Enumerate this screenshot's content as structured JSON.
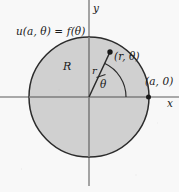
{
  "figure": {
    "width": 179,
    "height": 192,
    "background_color": "#f8f8f8",
    "disk_fill_color": "#cdcdcd",
    "stroke_color": "#2b2b2b",
    "axis_color": "#8a8a8a"
  },
  "axes": {
    "x_label": "x",
    "y_label": "y",
    "origin_x": 89,
    "origin_y": 97
  },
  "disk": {
    "center_x": 89,
    "center_y": 97,
    "radius": 60,
    "region_label": "R"
  },
  "labels": {
    "boundary_condition": "u(a, θ) = f(θ)",
    "radius_label": "r",
    "angle_label": "θ",
    "interior_point": "(r, θ)",
    "boundary_point": "(a, 0)"
  },
  "geometry": {
    "point_x": 110,
    "point_y": 52,
    "boundary_point_x": 148,
    "boundary_point_y": 97,
    "angle_degrees": 65
  }
}
